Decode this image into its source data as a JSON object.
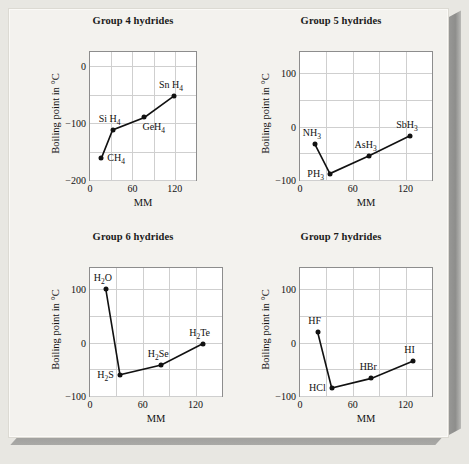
{
  "figure": {
    "background": "#f3f2ee",
    "axis_color": "#8d8d8d",
    "grid_color": "#cfcfcf",
    "marker_color": "#111111"
  },
  "chart_data": [
    {
      "type": "line",
      "title": "Group 4 hydrides",
      "xlabel": "MM",
      "ylabel": "Boiling point in °C",
      "xlim": [
        0,
        150
      ],
      "ylim": [
        -200,
        25
      ],
      "xticks": [
        0,
        60,
        120
      ],
      "xticklabels": [
        "0",
        "60",
        "120"
      ],
      "yticks": [
        0,
        -100,
        -200
      ],
      "yticklabels": [
        "0",
        "−100",
        "−200"
      ],
      "grid": true,
      "x": [
        16,
        32,
        77,
        119
      ],
      "values": [
        -162,
        -112,
        -90,
        -52
      ],
      "point_labels": [
        "CH₄",
        "SiH₄",
        "GeH₄",
        "SnH₄"
      ],
      "points": [
        {
          "label_html": "CH<sub>4</sub>",
          "x": 16,
          "y": -162,
          "pos": "right"
        },
        {
          "label_html": "Si H<sub>4</sub>",
          "x": 32,
          "y": -112,
          "pos": "above-left"
        },
        {
          "label_html": "GeH<sub>4</sub>",
          "x": 77,
          "y": -90,
          "pos": "below-right"
        },
        {
          "label_html": "Sn H<sub>4</sub>",
          "x": 119,
          "y": -52,
          "pos": "above-left"
        }
      ]
    },
    {
      "type": "line",
      "title": "Group 5 hydrides",
      "xlabel": "MM",
      "ylabel": "Boiling point in °C",
      "xlim": [
        0,
        150
      ],
      "ylim": [
        -100,
        140
      ],
      "xticks": [
        0,
        60,
        120
      ],
      "xticklabels": [
        "0",
        "60",
        "120"
      ],
      "yticks": [
        100,
        0,
        -100
      ],
      "yticklabels": [
        "100",
        "0",
        "−100"
      ],
      "grid": true,
      "x": [
        17,
        34,
        78,
        125
      ],
      "values": [
        -33,
        -88,
        -55,
        -17
      ],
      "point_labels": [
        "NH₃",
        "PH₃",
        "AsH₃",
        "SbH₃"
      ],
      "points": [
        {
          "label_html": "NH<sub>3</sub>",
          "x": 17,
          "y": -33,
          "pos": "above-left"
        },
        {
          "label_html": "PH<sub>3</sub>",
          "x": 34,
          "y": -88,
          "pos": "left"
        },
        {
          "label_html": "AsH<sub>3</sub>",
          "x": 78,
          "y": -55,
          "pos": "above-left"
        },
        {
          "label_html": "SbH<sub>3</sub>",
          "x": 125,
          "y": -17,
          "pos": "above-left"
        }
      ]
    },
    {
      "type": "line",
      "title": "Group 6 hydrides",
      "xlabel": "MM",
      "ylabel": "Boiling point in °C",
      "xlim": [
        0,
        150
      ],
      "ylim": [
        -100,
        140
      ],
      "xticks": [
        0,
        60,
        120
      ],
      "xticklabels": [
        "0",
        "60",
        "120"
      ],
      "yticks": [
        100,
        0,
        -100
      ],
      "yticklabels": [
        "100",
        "0",
        "−100"
      ],
      "grid": true,
      "x": [
        18,
        34,
        81,
        128
      ],
      "values": [
        100,
        -60,
        -42,
        -2
      ],
      "point_labels": [
        "H₂O",
        "H₂S",
        "H₂Se",
        "H₂Te"
      ],
      "points": [
        {
          "label_html": "H<sub>2</sub>O",
          "x": 18,
          "y": 100,
          "pos": "above-left"
        },
        {
          "label_html": "H<sub>2</sub>S",
          "x": 34,
          "y": -60,
          "pos": "left"
        },
        {
          "label_html": "H<sub>2</sub>Se",
          "x": 81,
          "y": -42,
          "pos": "above-left"
        },
        {
          "label_html": "H<sub>2</sub>Te",
          "x": 128,
          "y": -2,
          "pos": "above-left"
        }
      ]
    },
    {
      "type": "line",
      "title": "Group 7 hydrides",
      "xlabel": "MM",
      "ylabel": "Boiling point in °C",
      "xlim": [
        0,
        150
      ],
      "ylim": [
        -100,
        140
      ],
      "xticks": [
        0,
        60,
        120
      ],
      "xticklabels": [
        "0",
        "60",
        "120"
      ],
      "yticks": [
        100,
        0,
        -100
      ],
      "yticklabels": [
        "100",
        "0",
        "−100"
      ],
      "grid": true,
      "x": [
        20,
        36,
        81,
        128
      ],
      "values": [
        20,
        -85,
        -67,
        -35
      ],
      "point_labels": [
        "HF",
        "HCl",
        "HBr",
        "HI"
      ],
      "points": [
        {
          "label_html": "HF",
          "x": 20,
          "y": 20,
          "pos": "above-left"
        },
        {
          "label_html": "HCl",
          "x": 36,
          "y": -85,
          "pos": "left"
        },
        {
          "label_html": "HBr",
          "x": 81,
          "y": -67,
          "pos": "above-left"
        },
        {
          "label_html": "HI",
          "x": 128,
          "y": -35,
          "pos": "above-left"
        }
      ]
    }
  ]
}
